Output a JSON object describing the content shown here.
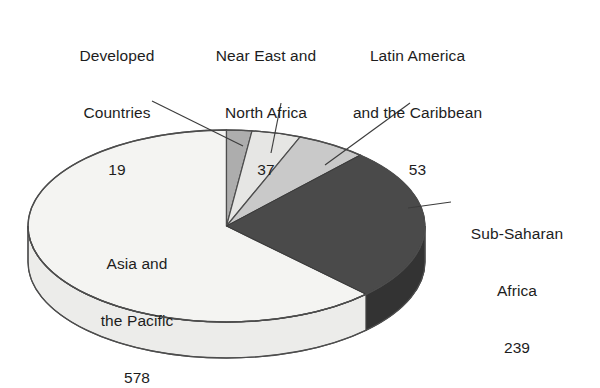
{
  "chart_data": {
    "type": "pie",
    "title": "",
    "subtitle": "",
    "xlabel": "",
    "ylabel": "",
    "legend_position": "none",
    "grid": false,
    "total": 926,
    "categories": [
      "Asia and the Pacific",
      "Sub-Saharan Africa",
      "Latin America and the Caribbean",
      "Near East and North Africa",
      "Developed Countries"
    ],
    "values": [
      578,
      239,
      53,
      37,
      19
    ],
    "slices": [
      {
        "name": "asia-and-the-pacific",
        "label_line1": "Asia and",
        "label_line2": "the Pacific",
        "value": "578",
        "value_num": 578,
        "percent": 62.4,
        "angle_deg": 224.7,
        "color": "#f4f4f2",
        "side_color": "#ececea",
        "label_placement": "inside"
      },
      {
        "name": "sub-saharan-africa",
        "label_line1": "Sub-Saharan",
        "label_line2": "Africa",
        "value": "239",
        "value_num": 239,
        "percent": 25.8,
        "angle_deg": 92.9,
        "color": "#4a4a4a",
        "side_color": "#333333",
        "label_placement": "outside-right"
      },
      {
        "name": "latin-america-and-the-caribbean",
        "label_line1": "Latin America",
        "label_line2": "and the Caribbean",
        "value": "53",
        "value_num": 53,
        "percent": 5.7,
        "angle_deg": 20.6,
        "color": "#c9c9c9",
        "side_color": "#b4b4b4",
        "label_placement": "outside-top"
      },
      {
        "name": "near-east-and-north-africa",
        "label_line1": "Near East and",
        "label_line2": "North Africa",
        "value": "37",
        "value_num": 37,
        "percent": 4.0,
        "angle_deg": 14.4,
        "color": "#e6e6e4",
        "side_color": "#d4d4d2",
        "label_placement": "outside-top"
      },
      {
        "name": "developed-countries",
        "label_line1": "Developed",
        "label_line2": "Countries",
        "value": "19",
        "value_num": 19,
        "percent": 2.1,
        "angle_deg": 7.4,
        "color": "#adadad",
        "side_color": "#999999",
        "label_placement": "outside-top"
      }
    ],
    "colors": {
      "background": "#ffffff",
      "outline": "#4d4d4d",
      "leader_line": "#3c3c3c",
      "text": "#1d1d1d"
    }
  }
}
